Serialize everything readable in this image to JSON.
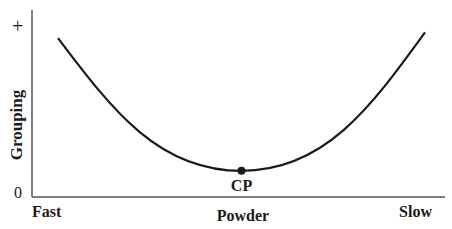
{
  "chart_data": {
    "type": "line",
    "title": "",
    "xlabel": "Powder",
    "ylabel": "Grouping",
    "x_tick_labels": {
      "left": "Fast",
      "right": "Slow"
    },
    "y_tick_labels": {
      "top": "+",
      "bottom": "0"
    },
    "xlim": [
      0,
      1
    ],
    "ylim": [
      0,
      1
    ],
    "grid": false,
    "legend": "none",
    "series": [
      {
        "name": "grouping-curve",
        "shape": "U-shaped",
        "points": [
          [
            0.0,
            0.85
          ],
          [
            0.5,
            0.14
          ],
          [
            1.0,
            0.88
          ]
        ]
      }
    ],
    "annotations": [
      {
        "label": "CP",
        "x": 0.5,
        "y": 0.14,
        "marker": "dot"
      }
    ],
    "colors": {
      "curve": "#1a1a1a",
      "axis": "#555555"
    }
  }
}
